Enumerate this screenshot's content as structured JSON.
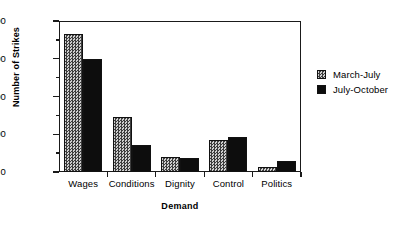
{
  "chart_data": {
    "type": "bar",
    "title": "",
    "xlabel": "Demand",
    "ylabel": "Number of Strikes",
    "categories": [
      "Wages",
      "Conditions",
      "Dignity",
      "Control",
      "Politics"
    ],
    "series": [
      {
        "name": "March-July",
        "values": [
          365,
          147,
          40,
          86,
          12
        ],
        "swatch": "checkered-gray"
      },
      {
        "name": "July-October",
        "values": [
          300,
          72,
          38,
          93,
          28
        ],
        "swatch": "solid-black"
      }
    ],
    "ylim": [
      0,
      400
    ],
    "y_ticks_major": [
      0,
      100,
      200,
      300,
      400
    ],
    "y_ticks_minor": [
      50,
      150,
      250,
      350
    ],
    "y_tick_labels": [
      "0",
      "100",
      "200",
      "300",
      "400"
    ],
    "grid": false,
    "legend_position": "right",
    "colors": {
      "axis": "#1a1a1a",
      "series_a_fill": "#cfcfcf",
      "series_a_hatch": "#3d3d3d",
      "series_b_fill": "#0d0d0d",
      "background": "#ffffff",
      "text": "#000000"
    }
  },
  "legend": {
    "items": [
      {
        "label": "March-July"
      },
      {
        "label": "July-October"
      }
    ]
  }
}
